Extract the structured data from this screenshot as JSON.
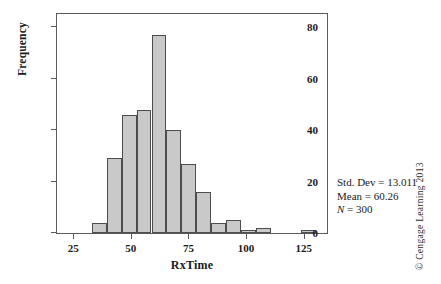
{
  "chart_data": {
    "type": "bar",
    "title": "",
    "xlabel": "RxTime",
    "ylabel": "Frequency",
    "xlim": [
      18,
      136
    ],
    "ylim": [
      0,
      86
    ],
    "grid": false,
    "legend": null,
    "bin_width": 6.5,
    "bar_fill": "#c9c9c9",
    "bar_edge": "#4d4d4d",
    "xticks": [
      25,
      50,
      75,
      100,
      125
    ],
    "yticks": [
      0,
      20,
      40,
      60,
      80
    ],
    "xtick_labels": [
      "25",
      "50",
      "75",
      "100",
      "125"
    ],
    "ytick_labels": [
      "0",
      "20",
      "40",
      "60",
      "80"
    ],
    "bins": [
      {
        "left": 33.0,
        "right": 39.5,
        "value": 4
      },
      {
        "left": 39.5,
        "right": 46.0,
        "value": 29
      },
      {
        "left": 46.0,
        "right": 52.5,
        "value": 46
      },
      {
        "left": 52.5,
        "right": 59.0,
        "value": 48
      },
      {
        "left": 59.0,
        "right": 65.5,
        "value": 77
      },
      {
        "left": 65.5,
        "right": 72.0,
        "value": 40
      },
      {
        "left": 72.0,
        "right": 78.5,
        "value": 27
      },
      {
        "left": 78.5,
        "right": 85.0,
        "value": 16
      },
      {
        "left": 85.0,
        "right": 91.5,
        "value": 4
      },
      {
        "left": 91.5,
        "right": 98.0,
        "value": 5
      },
      {
        "left": 98.0,
        "right": 104.5,
        "value": 1
      },
      {
        "left": 104.5,
        "right": 111.0,
        "value": 2
      },
      {
        "left": 124.0,
        "right": 130.5,
        "value": 1
      }
    ],
    "categories": [
      "33-39.5",
      "39.5-46",
      "46-52.5",
      "52.5-59",
      "59-65.5",
      "65.5-72",
      "72-78.5",
      "78.5-85",
      "85-91.5",
      "91.5-98",
      "98-104.5",
      "104.5-111",
      "124-130.5"
    ],
    "values": [
      4,
      29,
      46,
      48,
      77,
      40,
      27,
      16,
      4,
      5,
      1,
      2,
      1
    ],
    "annotations": {
      "std_dev": "Std. Dev = 13.011",
      "mean": "Mean = 60.26",
      "n_symbol": "N",
      "n_value": " = 300"
    }
  },
  "footer": {
    "copyright": "© Cengage Learning 2013"
  }
}
